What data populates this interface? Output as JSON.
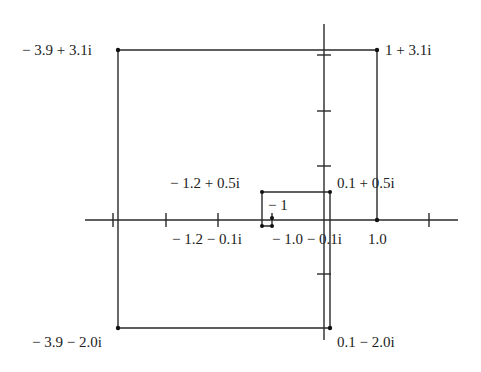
{
  "diagram": {
    "title": "",
    "colors": {
      "line": "#2a2a2a",
      "background": "#ffffff",
      "text": "#222222"
    },
    "axes": {
      "origin_px": [
        325,
        220
      ],
      "x_scale_px": 52.5,
      "y_scale_px": 55,
      "x_ticks": [
        -4,
        -3,
        -2,
        -1,
        1,
        2
      ],
      "y_ticks": [
        3,
        2,
        1,
        -1
      ]
    },
    "rectangles": [
      {
        "name": "large",
        "corners": [
          "-3.9+3.1i",
          "1+3.1i",
          "0.1-2.0i",
          "-3.9-2.0i"
        ]
      },
      {
        "name": "medium",
        "corners": [
          "-1.2+0.5i",
          "0.1+0.5i",
          "0.1-0.1i",
          "-1.2-0.1i"
        ]
      }
    ],
    "labels": [
      {
        "id": "tl",
        "text": "− 3.9 + 3.1i"
      },
      {
        "id": "tr",
        "text": "1 + 3.1i"
      },
      {
        "id": "mtl",
        "text": "− 1.2 + 0.5i"
      },
      {
        "id": "mtr",
        "text": "0.1 + 0.5i"
      },
      {
        "id": "neg1",
        "text": "− 1"
      },
      {
        "id": "mbl",
        "text": "− 1.2 − 0.1i"
      },
      {
        "id": "mbr",
        "text": "− 1.0 − 0.1i"
      },
      {
        "id": "one",
        "text": "1.0"
      },
      {
        "id": "bl",
        "text": "− 3.9 − 2.0i"
      },
      {
        "id": "br",
        "text": "0.1 − 2.0i"
      }
    ]
  }
}
